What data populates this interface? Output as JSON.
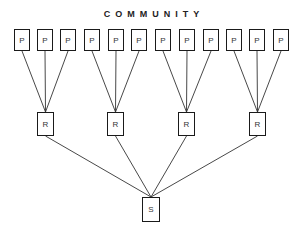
{
  "title": "COMMUNITY",
  "colors": {
    "line": "#333333",
    "border": "#1a1a1a",
    "background": "#ffffff"
  },
  "nodes": {
    "people": [
      {
        "label": "P",
        "x": 14,
        "y": 29,
        "w": 16,
        "h": 22,
        "parent": 0
      },
      {
        "label": "P",
        "x": 37,
        "y": 29,
        "w": 16,
        "h": 22,
        "parent": 0
      },
      {
        "label": "P",
        "x": 60,
        "y": 29,
        "w": 16,
        "h": 22,
        "parent": 0
      },
      {
        "label": "P",
        "x": 84,
        "y": 29,
        "w": 16,
        "h": 22,
        "parent": 1
      },
      {
        "label": "P",
        "x": 108,
        "y": 29,
        "w": 16,
        "h": 22,
        "parent": 1
      },
      {
        "label": "P",
        "x": 131,
        "y": 29,
        "w": 16,
        "h": 22,
        "parent": 1
      },
      {
        "label": "P",
        "x": 155,
        "y": 29,
        "w": 16,
        "h": 22,
        "parent": 2
      },
      {
        "label": "P",
        "x": 179,
        "y": 29,
        "w": 16,
        "h": 22,
        "parent": 2
      },
      {
        "label": "P",
        "x": 203,
        "y": 29,
        "w": 16,
        "h": 22,
        "parent": 2
      },
      {
        "label": "P",
        "x": 226,
        "y": 29,
        "w": 16,
        "h": 22,
        "parent": 3
      },
      {
        "label": "P",
        "x": 249,
        "y": 29,
        "w": 16,
        "h": 22,
        "parent": 3
      },
      {
        "label": "P",
        "x": 273,
        "y": 29,
        "w": 16,
        "h": 22,
        "parent": 3
      }
    ],
    "representatives": [
      {
        "label": "R",
        "x": 37,
        "y": 112,
        "w": 17,
        "h": 24
      },
      {
        "label": "R",
        "x": 107,
        "y": 112,
        "w": 17,
        "h": 24
      },
      {
        "label": "R",
        "x": 178,
        "y": 112,
        "w": 17,
        "h": 24
      },
      {
        "label": "R",
        "x": 249,
        "y": 112,
        "w": 17,
        "h": 24
      }
    ],
    "state": {
      "label": "S",
      "x": 142,
      "y": 197,
      "w": 18,
      "h": 25
    }
  }
}
